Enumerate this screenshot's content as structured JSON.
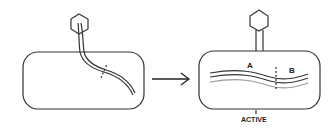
{
  "diagram": {
    "title": "",
    "left_panel": {
      "description": "phage injecting DNA into bacterial cell"
    },
    "arrow": {
      "description": "transition arrow"
    },
    "right_panel": {
      "labels": {
        "a": "A",
        "b": "B"
      },
      "caption": "ACTIVE"
    }
  }
}
